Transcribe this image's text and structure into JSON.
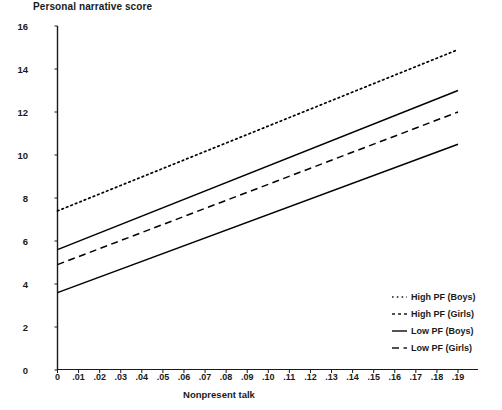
{
  "chart_data": {
    "type": "line",
    "title": "",
    "ylabel": "Personal narrative score",
    "xlabel": "Nonpresent talk",
    "xlim": [
      0,
      0.19
    ],
    "ylim": [
      0,
      16
    ],
    "grid": false,
    "legend_position": "bottom-right-inside",
    "x_tick_labels": [
      "0",
      ".01",
      ".02",
      ".03",
      ".04",
      ".05",
      ".06",
      ".07",
      ".08",
      ".09",
      ".10",
      ".11",
      ".12",
      ".13",
      ".14",
      ".15",
      ".16",
      ".17",
      ".18",
      ".19"
    ],
    "x_tick_values": [
      0,
      0.01,
      0.02,
      0.03,
      0.04,
      0.05,
      0.06,
      0.07,
      0.08,
      0.09,
      0.1,
      0.11,
      0.12,
      0.13,
      0.14,
      0.15,
      0.16,
      0.17,
      0.18,
      0.19
    ],
    "y_tick_labels": [
      "0",
      "2",
      "4",
      "6",
      "8",
      "10",
      "12",
      "14",
      "16"
    ],
    "y_tick_values": [
      0,
      2,
      4,
      6,
      8,
      10,
      12,
      14,
      16
    ],
    "x": [
      0,
      0.19
    ],
    "series": [
      {
        "name": "High PF (Boys)",
        "style": "dotted",
        "color": "#000000",
        "values": [
          7.4,
          14.9
        ],
        "intercept": 7.4,
        "slope": 39.5
      },
      {
        "name": "High PF (Girls)",
        "style": "solid",
        "color": "#000000",
        "values": [
          5.6,
          13.0
        ],
        "intercept": 5.6,
        "slope": 38.9
      },
      {
        "name": "Low PF (Boys)",
        "style": "dashed",
        "color": "#000000",
        "values": [
          4.9,
          12.0
        ],
        "intercept": 4.9,
        "slope": 37.4
      },
      {
        "name": "Low PF (Girls)",
        "style": "solid",
        "color": "#000000",
        "values": [
          3.6,
          10.5
        ],
        "intercept": 3.6,
        "slope": 36.3
      }
    ]
  },
  "legend": {
    "entries": [
      {
        "label": "High PF (Boys)",
        "style": "dotted"
      },
      {
        "label": "High PF (Girls)",
        "style": "dashed-short"
      },
      {
        "label": "Low PF (Boys)",
        "style": "solid"
      },
      {
        "label": "Low PF (Girls)",
        "style": "dashed"
      }
    ]
  },
  "axes": {
    "y_axis_title": "Personal narrative score",
    "x_axis_title": "Nonpresent talk"
  }
}
